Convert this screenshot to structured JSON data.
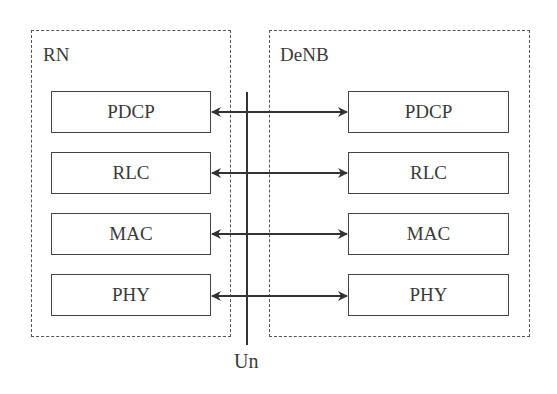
{
  "diagram": {
    "left_node": {
      "label": "RN",
      "layers": [
        "PDCP",
        "RLC",
        "MAC",
        "PHY"
      ]
    },
    "right_node": {
      "label": "DeNB",
      "layers": [
        "PDCP",
        "RLC",
        "MAC",
        "PHY"
      ]
    },
    "interface": {
      "label": "Un"
    },
    "connections": [
      {
        "from": "RN.PDCP",
        "to": "DeNB.PDCP",
        "type": "bidirectional"
      },
      {
        "from": "RN.RLC",
        "to": "DeNB.RLC",
        "type": "bidirectional"
      },
      {
        "from": "RN.MAC",
        "to": "DeNB.MAC",
        "type": "bidirectional"
      },
      {
        "from": "RN.PHY",
        "to": "DeNB.PHY",
        "type": "bidirectional"
      }
    ],
    "colors": {
      "line": "#333333",
      "border": "#444444",
      "dashed": "#555555",
      "text": "#3a3a3a"
    }
  }
}
